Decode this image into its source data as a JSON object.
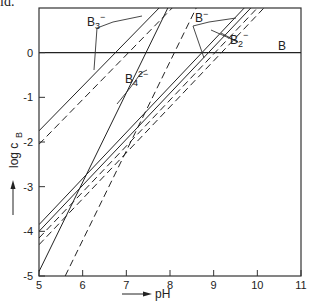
{
  "caption_fragment": "id.",
  "chart_data": {
    "type": "line",
    "title": "",
    "xlabel": "pH",
    "ylabel": "log c_B",
    "xlim": [
      5,
      11
    ],
    "ylim": [
      -5,
      1
    ],
    "xticks": [
      5,
      6,
      7,
      8,
      9,
      10,
      11
    ],
    "yticks": [
      0,
      -1,
      -2,
      -3,
      -4,
      -5
    ],
    "grid": false,
    "reference_line": {
      "y": 0,
      "label": "B"
    },
    "series": [
      {
        "name": "B3- (solid)",
        "style": "solid",
        "points": [
          [
            5,
            -1.75
          ],
          [
            7.75,
            1.0
          ]
        ]
      },
      {
        "name": "B3- (dashed)",
        "style": "dashed",
        "points": [
          [
            5,
            -2.05
          ],
          [
            8.05,
            1.0
          ]
        ]
      },
      {
        "name": "B4 2- (solid)",
        "style": "solid",
        "points": [
          [
            5,
            -4.9
          ],
          [
            7.95,
            1.0
          ]
        ]
      },
      {
        "name": "B4 2- (dashed)",
        "style": "dashed",
        "points": [
          [
            5.6,
            -5.0
          ],
          [
            8.6,
            1.0
          ]
        ]
      },
      {
        "name": "B- (solid)",
        "style": "solid",
        "points": [
          [
            5,
            -3.85
          ],
          [
            9.7,
            1.0
          ]
        ]
      },
      {
        "name": "B2- (solid)",
        "style": "solid",
        "points": [
          [
            5,
            -4.0
          ],
          [
            9.85,
            1.0
          ]
        ]
      },
      {
        "name": "B- (dashed)",
        "style": "dashed",
        "points": [
          [
            5,
            -4.15
          ],
          [
            10.0,
            1.0
          ]
        ]
      },
      {
        "name": "B2- (dashed)",
        "style": "dashed",
        "points": [
          [
            5,
            -4.3
          ],
          [
            10.15,
            1.0
          ]
        ]
      }
    ],
    "annotations": [
      {
        "text": "B3-",
        "x": 6.55,
        "y": 0.6
      },
      {
        "text": "B4 2-",
        "x": 7.55,
        "y": -0.6
      },
      {
        "text": "B-",
        "x": 8.8,
        "y": 0.55
      },
      {
        "text": "B2-",
        "x": 10.2,
        "y": 0.25
      },
      {
        "text": "B",
        "x": 10.75,
        "y": 0.08
      }
    ]
  }
}
